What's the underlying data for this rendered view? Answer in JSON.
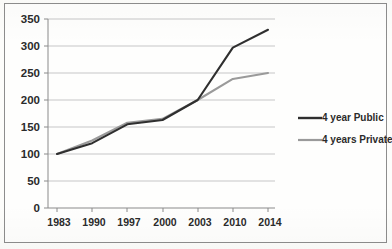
{
  "chart_data": {
    "type": "line",
    "title": "",
    "subtitle": "",
    "xlabel": "",
    "ylabel": "",
    "categories": [
      "1983",
      "1990",
      "1997",
      "2000",
      "2003",
      "2010",
      "2014"
    ],
    "series": [
      {
        "name": "4 year Public",
        "color": "#2f2f2f",
        "values": [
          100,
          120,
          155,
          163,
          200,
          297,
          330
        ]
      },
      {
        "name": "4 years Private",
        "color": "#9a9a9a",
        "values": [
          100,
          125,
          158,
          165,
          200,
          239,
          250
        ]
      }
    ],
    "ylim": [
      0,
      350
    ],
    "yticks": [
      0,
      50,
      100,
      150,
      200,
      250,
      300,
      350
    ],
    "ytick_labels": [
      "0",
      "50",
      "100",
      "150",
      "200",
      "250",
      "300",
      "350"
    ],
    "xtick_labels": [
      "1983",
      "1990",
      "1997",
      "2000",
      "2003",
      "2010",
      "2014"
    ],
    "grid": "horizontal",
    "legend_position": "right",
    "legend": [
      "4 year Public",
      "4 years Private"
    ]
  },
  "axes": {
    "y": {
      "ticks": [
        {
          "label": "350",
          "value": 350
        },
        {
          "label": "300",
          "value": 300
        },
        {
          "label": "250",
          "value": 250
        },
        {
          "label": "200",
          "value": 200
        },
        {
          "label": "150",
          "value": 150
        },
        {
          "label": "100",
          "value": 100
        },
        {
          "label": "50",
          "value": 50
        },
        {
          "label": "0",
          "value": 0
        }
      ]
    },
    "x": {
      "ticks": [
        {
          "label": "1983"
        },
        {
          "label": "1990"
        },
        {
          "label": "1997"
        },
        {
          "label": "2000"
        },
        {
          "label": "2003"
        },
        {
          "label": "2010"
        },
        {
          "label": "2014"
        }
      ]
    }
  },
  "legend": {
    "items": [
      {
        "label": "4 year Public",
        "color": "#2f2f2f"
      },
      {
        "label": "4 years Private",
        "color": "#9a9a9a"
      }
    ]
  },
  "colors": {
    "public": "#2f2f2f",
    "private": "#9a9a9a",
    "grid": "#b9b9b9",
    "axis": "#8a8a8a",
    "border": "#8d8d8d",
    "background": "#fefefd",
    "text": "#2b2b2b"
  }
}
